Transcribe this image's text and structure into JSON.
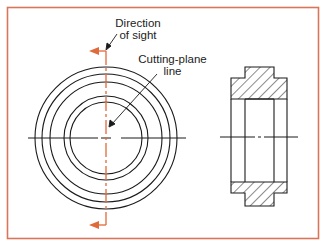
{
  "figure": {
    "frame_color": "#d9765a",
    "accent_color": "#e06a3a",
    "line_color": "#1a1a1a",
    "labels": {
      "direction_of_sight_line1": "Direction",
      "direction_of_sight_line2": "of sight",
      "cutting_plane_line1": "Cutting-plane",
      "cutting_plane_line2": "line"
    },
    "front_view": {
      "center": [
        106,
        138
      ],
      "radii": [
        71,
        64,
        56,
        42,
        36
      ]
    },
    "section_view": {
      "outer_x": [
        231,
        287
      ],
      "hub_x": [
        245,
        274
      ],
      "top": 67,
      "flange_top": 78,
      "bore_top": 99,
      "bore_bottom": 182,
      "flange_bottom": 193,
      "bottom": 206
    }
  }
}
